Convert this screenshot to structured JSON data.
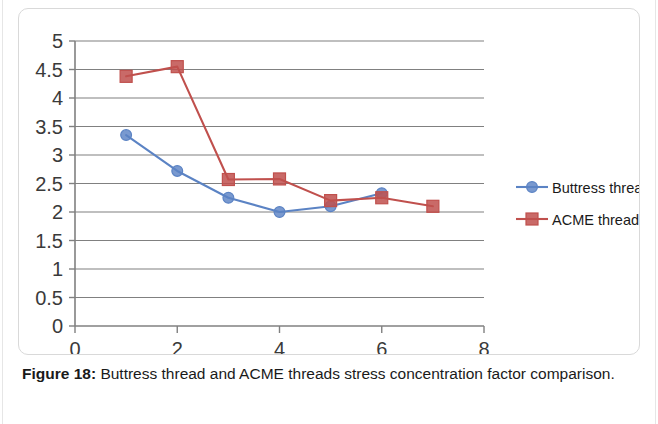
{
  "figure": {
    "caption_label": "Figure 18:",
    "caption_text": " Buttress thread and ACME threads stress concentration factor comparison."
  },
  "chart_data": {
    "type": "line",
    "title": "",
    "xlabel": "",
    "ylabel": "",
    "xlim": [
      0,
      8
    ],
    "ylim": [
      0,
      5
    ],
    "x_ticks": [
      0,
      2,
      4,
      6,
      8
    ],
    "x_tick_labels": [
      "0",
      "2",
      "4",
      "6",
      "8"
    ],
    "x_minor_ticks": [
      1,
      3,
      5,
      7
    ],
    "y_ticks": [
      0,
      0.5,
      1,
      1.5,
      2,
      2.5,
      3,
      3.5,
      4,
      4.5,
      5
    ],
    "y_tick_labels": [
      "0",
      "0.5",
      "1",
      "1.5",
      "2",
      "2.5",
      "3",
      "3.5",
      "4",
      "4.5",
      "5"
    ],
    "grid": "horizontal",
    "legend_position": "right",
    "series": [
      {
        "name": "Buttress threading",
        "color": "#5b83c4",
        "marker": "circle",
        "x": [
          1,
          2,
          3,
          4,
          5,
          6
        ],
        "values": [
          3.35,
          2.72,
          2.25,
          2.0,
          2.1,
          2.33
        ]
      },
      {
        "name": "ACME threading",
        "color": "#c0504d",
        "marker": "square",
        "x": [
          1,
          2,
          3,
          4,
          5,
          6,
          7
        ],
        "values": [
          4.38,
          4.55,
          2.57,
          2.58,
          2.2,
          2.25,
          2.1
        ]
      }
    ]
  },
  "colors": {
    "buttress": "#5b83c4",
    "acme": "#c0504d",
    "gridline": "#808080",
    "axis": "#808080",
    "frame": "#d9d9d9",
    "tick_text": "#3a3a3a"
  }
}
